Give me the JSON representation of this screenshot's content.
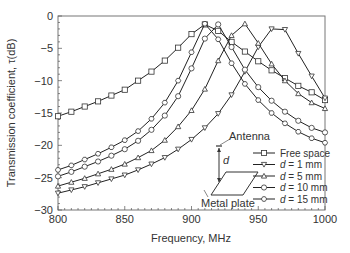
{
  "chart_data": {
    "type": "line",
    "title": "",
    "xlabel": "Frequency, MHz",
    "ylabel": "Transmission coefficient, τ(dB)",
    "xlim": [
      800,
      1000
    ],
    "ylim": [
      -30,
      0
    ],
    "xticks": [
      800,
      850,
      900,
      950,
      1000
    ],
    "yticks": [
      0,
      -5,
      -10,
      -15,
      -20,
      -25,
      -30
    ],
    "grid": false,
    "legend_position": "lower right (inside)",
    "series": [
      {
        "name": "Free space",
        "marker": "square",
        "x": [
          800,
          810,
          820,
          830,
          840,
          850,
          860,
          870,
          880,
          890,
          900,
          910,
          920,
          930,
          940,
          950,
          960,
          970,
          980,
          990,
          1000
        ],
        "y": [
          -15.5,
          -14.8,
          -14.0,
          -13.2,
          -12.3,
          -11.4,
          -10.0,
          -8.6,
          -6.9,
          -4.9,
          -2.8,
          -1.3,
          -2.3,
          -4.0,
          -5.5,
          -7.0,
          -8.4,
          -9.6,
          -10.8,
          -11.8,
          -13.0
        ]
      },
      {
        "name": "d = 1 mm",
        "marker": "down-triangle",
        "x": [
          800,
          810,
          820,
          830,
          840,
          850,
          860,
          870,
          880,
          890,
          900,
          910,
          920,
          930,
          940,
          950,
          960,
          970,
          980,
          990,
          1000
        ],
        "y": [
          -27.4,
          -26.9,
          -26.4,
          -25.8,
          -25.2,
          -24.6,
          -23.8,
          -22.9,
          -21.9,
          -20.6,
          -19.1,
          -17.3,
          -15.1,
          -12.2,
          -8.6,
          -4.8,
          -2.0,
          -2.1,
          -5.8,
          -9.3,
          -12.7
        ]
      },
      {
        "name": "d = 5 mm",
        "marker": "up-triangle",
        "x": [
          800,
          810,
          820,
          830,
          840,
          850,
          860,
          870,
          880,
          890,
          900,
          910,
          920,
          930,
          940,
          950,
          960,
          970,
          980,
          990,
          1000
        ],
        "y": [
          -26.3,
          -25.7,
          -25.1,
          -24.4,
          -23.7,
          -22.9,
          -21.9,
          -20.8,
          -19.2,
          -17.1,
          -14.6,
          -11.3,
          -6.9,
          -3.0,
          -1.2,
          -4.2,
          -7.4,
          -10.0,
          -12.0,
          -13.4,
          -14.3
        ]
      },
      {
        "name": "d = 10 mm",
        "marker": "circle",
        "x": [
          800,
          810,
          820,
          830,
          840,
          850,
          860,
          870,
          880,
          890,
          900,
          910,
          920,
          930,
          940,
          950,
          960,
          970,
          980,
          990,
          1000
        ],
        "y": [
          -24.8,
          -24.1,
          -23.3,
          -22.5,
          -21.6,
          -20.6,
          -19.3,
          -17.6,
          -15.4,
          -12.4,
          -8.1,
          -3.5,
          -1.3,
          -4.8,
          -8.3,
          -11.0,
          -13.1,
          -14.8,
          -16.2,
          -17.3,
          -18.0
        ]
      },
      {
        "name": "d = 15 mm",
        "marker": "hexagon",
        "x": [
          800,
          810,
          820,
          830,
          840,
          850,
          860,
          870,
          880,
          890,
          900,
          910,
          920,
          930,
          940,
          950,
          960,
          970,
          980,
          990,
          1000
        ],
        "y": [
          -23.8,
          -23.1,
          -22.2,
          -21.3,
          -20.3,
          -19.2,
          -17.8,
          -15.9,
          -13.4,
          -10.0,
          -5.6,
          -1.2,
          -3.6,
          -7.3,
          -10.5,
          -13.0,
          -15.0,
          -16.6,
          -17.9,
          -18.9,
          -19.6
        ]
      }
    ],
    "annotations": [
      "Antenna",
      "d",
      "Metal plate"
    ]
  },
  "inset": {
    "antenna_label": "Antenna",
    "distance_label": "d",
    "plate_label": "Metal plate"
  },
  "axes": {
    "xlabel": "Frequency, MHz",
    "ylabel": "Transmission coefficient, τ(dB)",
    "xtick_labels": [
      "800",
      "850",
      "900",
      "950",
      "1000"
    ],
    "ytick_labels": [
      "0",
      "−5",
      "−10",
      "−15",
      "−20",
      "−25",
      "−30"
    ]
  },
  "legend": [
    {
      "label": "Free space",
      "marker": "square"
    },
    {
      "label_prefix": "d",
      "label_suffix": " = 1 mm",
      "marker": "down-triangle"
    },
    {
      "label_prefix": "d",
      "label_suffix": " = 5 mm",
      "marker": "up-triangle"
    },
    {
      "label_prefix": "d",
      "label_suffix": " = 10 mm",
      "marker": "circle"
    },
    {
      "label_prefix": "d",
      "label_suffix": " = 15 mm",
      "marker": "hexagon"
    }
  ]
}
